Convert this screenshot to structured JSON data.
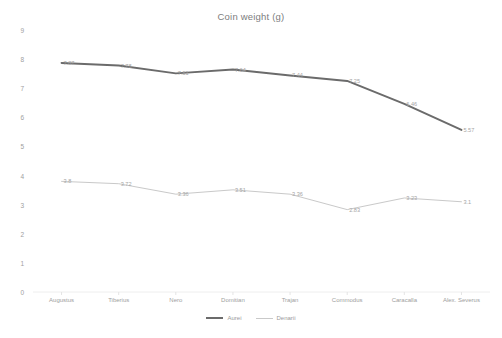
{
  "chart_data": {
    "type": "line",
    "title": "Coin weight (g)",
    "xlabel": "",
    "ylabel": "",
    "ylim": [
      0,
      9
    ],
    "ytick_step": 1,
    "yticks": [
      "9",
      "8",
      "7",
      "6",
      "5",
      "4",
      "3",
      "2",
      "1",
      "0"
    ],
    "grid": false,
    "legend_position": "bottom",
    "categories": [
      "Augustus",
      "Tiberius",
      "Nero",
      "Domitian",
      "Trajan",
      "Commodus",
      "Caracalla",
      "Alex. Severus"
    ],
    "series": [
      {
        "name": "Aurei",
        "color": "#6b6b6b",
        "width": 2,
        "values": [
          7.87,
          7.78,
          7.51,
          7.64,
          7.44,
          7.25,
          6.46,
          5.57
        ],
        "labels": [
          "7.87",
          "7.78",
          "7.51",
          "7.64",
          "7.44",
          "7.25",
          "6.46",
          "5.57"
        ]
      },
      {
        "name": "Denarii",
        "color": "#c9c9c9",
        "width": 1,
        "values": [
          3.8,
          3.72,
          3.36,
          3.51,
          3.36,
          2.83,
          3.23,
          3.1
        ],
        "labels": [
          "3.8",
          "3.72",
          "3.36",
          "3.51",
          "3.36",
          "2.83",
          "3.23",
          "3.1"
        ]
      }
    ]
  },
  "legend": {
    "items": [
      {
        "label": "Aurei"
      },
      {
        "label": "Denarii"
      }
    ]
  }
}
